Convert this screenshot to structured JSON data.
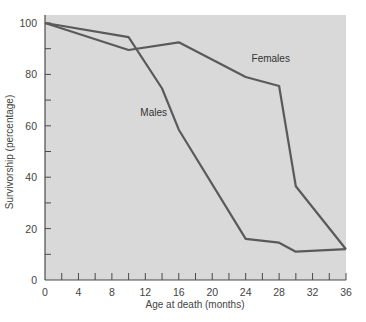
{
  "chart_data": {
    "type": "line",
    "title": "",
    "xlabel": "Age at death (months)",
    "ylabel": "Survivorship (percentage)",
    "xlim": [
      0,
      36
    ],
    "ylim": [
      0,
      100
    ],
    "x_ticks": [
      0,
      4,
      8,
      12,
      16,
      20,
      24,
      28,
      32,
      36
    ],
    "x_minor_ticks": [
      2,
      6,
      10,
      14,
      18,
      22,
      26,
      30,
      34
    ],
    "y_ticks": [
      0,
      20,
      40,
      60,
      80,
      100
    ],
    "y_minor_ticks": [
      10,
      30,
      50,
      70,
      90
    ],
    "grid": false,
    "legend": "inline labels",
    "series": [
      {
        "name": "Females",
        "x": [
          0,
          10,
          16,
          24,
          28,
          30,
          36
        ],
        "values": [
          100,
          89.5,
          92.5,
          79,
          75.5,
          36.5,
          12
        ],
        "label_pos": [
          27,
          85
        ]
      },
      {
        "name": "Males",
        "x": [
          0,
          10,
          14,
          16,
          24,
          28,
          30,
          36
        ],
        "values": [
          100,
          94.5,
          74.5,
          58.5,
          16,
          14.5,
          11,
          12
        ],
        "label_pos": [
          13,
          64
        ]
      }
    ],
    "colors": {
      "plot_background": "#d9d9d9",
      "line": "#5a5a5a",
      "axis": "#4a4a4a"
    }
  }
}
